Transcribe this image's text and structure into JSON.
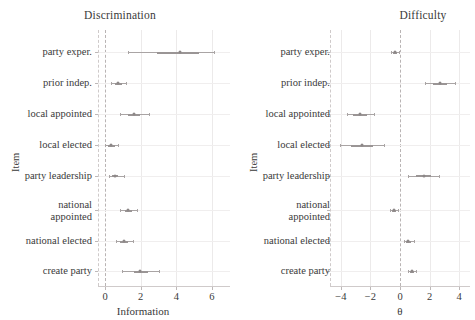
{
  "figure": {
    "background": "#ffffff",
    "line_color": "#a9a4a4",
    "point_color": "#8d8888",
    "grid_color": "#eceaea",
    "zero_line_color": "#b9b4b4",
    "text_color": "#3a3a3a"
  },
  "items": [
    "party exper.",
    "prior indep.",
    "local appointed",
    "local elected",
    "party leadership",
    "national\nappointed",
    "national elected",
    "create party"
  ],
  "chart_data": [
    {
      "type": "scatter",
      "title": "Discrimination",
      "xlabel": "Information",
      "ylabel": "Item",
      "xlim": [
        -0.35,
        6.6
      ],
      "xticks": [
        0,
        2,
        4,
        6
      ],
      "xticklabels": [
        "0",
        "2",
        "4",
        "6"
      ],
      "grid": true,
      "zero_line": 0,
      "categories": [
        "party exper.",
        "prior indep.",
        "local appointed",
        "local elected",
        "party leadership",
        "national appointed",
        "national elected",
        "create party"
      ],
      "values": [
        4.2,
        0.75,
        1.6,
        0.35,
        0.55,
        1.3,
        1.05,
        1.95
      ],
      "ci_low": [
        1.3,
        0.35,
        0.85,
        0.0,
        0.2,
        0.85,
        0.6,
        0.95
      ],
      "ci_high": [
        6.1,
        1.2,
        2.45,
        0.75,
        1.05,
        1.8,
        1.55,
        3.05
      ],
      "inner_low": [
        2.9,
        0.55,
        1.3,
        0.15,
        0.4,
        1.1,
        0.85,
        1.6
      ],
      "inner_high": [
        5.3,
        0.95,
        1.95,
        0.55,
        0.75,
        1.5,
        1.3,
        2.4
      ]
    },
    {
      "type": "scatter",
      "title": "Difficulty",
      "xlabel": "θ",
      "ylabel": "Item",
      "xlim": [
        -4.9,
        4.9
      ],
      "xticks": [
        -4,
        -2,
        0,
        2,
        4
      ],
      "xticklabels": [
        "−4",
        "−2",
        "0",
        "2",
        "4"
      ],
      "grid": true,
      "zero_line": 0,
      "categories": [
        "party exper.",
        "prior indep.",
        "local appointed",
        "local elected",
        "party leadership",
        "national appointed",
        "national elected",
        "create party"
      ],
      "values": [
        -0.35,
        2.7,
        -2.7,
        -2.55,
        1.6,
        -0.4,
        0.55,
        0.8
      ],
      "ci_low": [
        -0.6,
        1.7,
        -3.6,
        -4.05,
        0.55,
        -0.7,
        0.25,
        0.55
      ],
      "ci_high": [
        -0.1,
        3.7,
        -1.75,
        -1.1,
        2.65,
        -0.15,
        0.95,
        1.1
      ],
      "inner_low": [
        -0.5,
        2.2,
        -3.15,
        -3.3,
        1.1,
        -0.55,
        0.4,
        0.7
      ],
      "inner_high": [
        -0.2,
        3.2,
        -2.25,
        -1.8,
        2.1,
        -0.25,
        0.75,
        0.95
      ]
    }
  ]
}
